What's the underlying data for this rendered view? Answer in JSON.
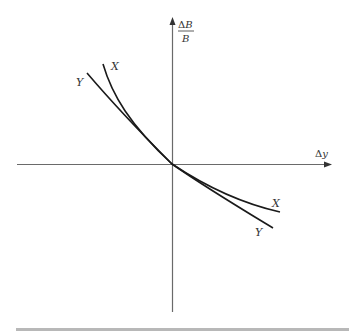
{
  "diagram": {
    "axes": {
      "x_label_delta": "Δ",
      "x_label_var": "y",
      "y_label_num_delta": "Δ",
      "y_label_num_var": "B",
      "y_label_den": "B"
    },
    "curves": [
      {
        "name": "X",
        "label": "X"
      },
      {
        "name": "Y",
        "label": "Y"
      }
    ],
    "colors": {
      "axis": "#6a6a6a",
      "curve": "#1a1a1a",
      "bottom_bar": "#b8b8b8"
    }
  }
}
